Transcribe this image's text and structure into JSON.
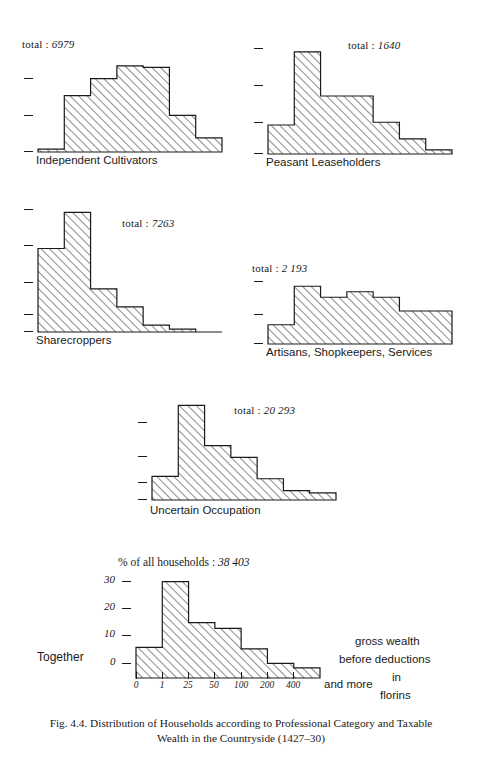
{
  "figure": {
    "caption_line1": "Fig. 4.4. Distribution of Households according to Professional Category and Taxable",
    "caption_line2": "Wealth in the Countryside (1427–30)",
    "ink_color": "#1a1a1a",
    "background": "#ffffff"
  },
  "axis": {
    "x_tick_labels": [
      "0",
      "1",
      "25",
      "50",
      "100",
      "200",
      "400"
    ],
    "x_and_more": "and more",
    "y_tick_labels": [
      "30",
      "20",
      "10",
      "0"
    ],
    "y_tick_values": [
      30,
      20,
      10,
      0
    ]
  },
  "notes": {
    "gross_wealth": "gross wealth",
    "before_deductions": "before deductions",
    "in": "in",
    "florins": "florins"
  },
  "labels": {
    "together": "Together",
    "total_prefix": "total :",
    "pct_title_prefix": "% of all households :"
  },
  "chart_data": {
    "type": "bar",
    "title": "Fig. 4.4. Distribution of Households according to Professional Category and Taxable Wealth in the Countryside (1427–30)",
    "xlabel": "gross wealth before deductions in florins",
    "ylabel": "% of all households",
    "ylim": [
      0,
      40
    ],
    "grid": false,
    "legend": "none",
    "categories": [
      "0",
      "1",
      "25",
      "50",
      "100",
      "200",
      "400 and more"
    ],
    "panels": [
      {
        "name": "Independent Cultivators",
        "total_label": "6979",
        "total_text": "total : 6979",
        "values": [
          1.0,
          20.0,
          26.0,
          30.5,
          30.0,
          13.0,
          5.0
        ]
      },
      {
        "name": "Peasant Leaseholders",
        "total_label": "1640",
        "total_text": "total : 1640",
        "values": [
          10.5,
          37.0,
          21.0,
          21.0,
          11.5,
          5.5,
          1.5
        ]
      },
      {
        "name": "Sharecroppers",
        "total_label": "7263",
        "total_text": "total : 7263",
        "values": [
          30.0,
          43.0,
          15.5,
          9.0,
          2.5,
          1.0,
          0.0
        ]
      },
      {
        "name": "Artisans, Shopkeepers, Services",
        "total_label": "2 193",
        "total_text": "total : 2 193",
        "values": [
          7.0,
          21.0,
          17.0,
          19.0,
          17.0,
          12.0,
          12.0
        ]
      },
      {
        "name": "Uncertain Occupation",
        "total_label": "20 293",
        "total_text": "total : 20 293",
        "values": [
          10.0,
          40.0,
          23.0,
          18.0,
          9.0,
          4.0,
          3.0
        ]
      },
      {
        "name": "Together",
        "total_label": "38 403",
        "total_text": "% of all households : 38 403",
        "values": [
          10.5,
          33.0,
          19.0,
          17.0,
          10.0,
          5.0,
          3.5
        ]
      }
    ]
  }
}
